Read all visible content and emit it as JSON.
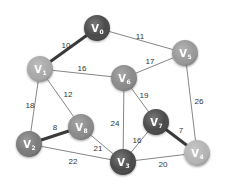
{
  "diagram": {
    "type": "weighted-undirected-graph",
    "nodes": [
      {
        "id": "V0",
        "label": "V",
        "sub": "0",
        "x": 97,
        "y": 28,
        "color": "#4a4a4a"
      },
      {
        "id": "V1",
        "label": "V",
        "sub": "1",
        "x": 40,
        "y": 69,
        "color": "#a8a8a8"
      },
      {
        "id": "V2",
        "label": "V",
        "sub": "2",
        "x": 29,
        "y": 144,
        "color": "#7a7a7a"
      },
      {
        "id": "V3",
        "label": "V",
        "sub": "3",
        "x": 123,
        "y": 162,
        "color": "#4a4a4a"
      },
      {
        "id": "V4",
        "label": "V",
        "sub": "4",
        "x": 197,
        "y": 153,
        "color": "#b4b4b4"
      },
      {
        "id": "V5",
        "label": "V",
        "sub": "5",
        "x": 185,
        "y": 53,
        "color": "#999999"
      },
      {
        "id": "V6",
        "label": "V",
        "sub": "6",
        "x": 124,
        "y": 78,
        "color": "#8a8a8a"
      },
      {
        "id": "V7",
        "label": "V",
        "sub": "7",
        "x": 156,
        "y": 122,
        "color": "#4a4a4a"
      },
      {
        "id": "V8",
        "label": "V",
        "sub": "8",
        "x": 81,
        "y": 127,
        "color": "#8a8a8a"
      }
    ],
    "edges": [
      {
        "from": "V0",
        "to": "V1",
        "weight": "10",
        "highlighted": true,
        "lx": 66,
        "ly": 46
      },
      {
        "from": "V0",
        "to": "V5",
        "weight": "11",
        "highlighted": false,
        "lx": 140,
        "ly": 37
      },
      {
        "from": "V1",
        "to": "V6",
        "weight": "16",
        "highlighted": false,
        "lx": 82,
        "ly": 69
      },
      {
        "from": "V6",
        "to": "V5",
        "weight": "17",
        "highlighted": false,
        "lx": 150,
        "ly": 62
      },
      {
        "from": "V1",
        "to": "V2",
        "weight": "18",
        "highlighted": false,
        "lx": 30,
        "ly": 106
      },
      {
        "from": "V1",
        "to": "V8",
        "weight": "12",
        "highlighted": false,
        "lx": 68,
        "ly": 95
      },
      {
        "from": "V2",
        "to": "V8",
        "weight": "8",
        "highlighted": true,
        "lx": 55,
        "ly": 128
      },
      {
        "from": "V2",
        "to": "V3",
        "weight": "22",
        "highlighted": false,
        "lx": 73,
        "ly": 162
      },
      {
        "from": "V8",
        "to": "V3",
        "weight": "21",
        "highlighted": false,
        "lx": 98,
        "ly": 149
      },
      {
        "from": "V6",
        "to": "V3",
        "weight": "24",
        "highlighted": false,
        "lx": 115,
        "ly": 124
      },
      {
        "from": "V6",
        "to": "V7",
        "weight": "19",
        "highlighted": false,
        "lx": 144,
        "ly": 96
      },
      {
        "from": "V5",
        "to": "V4",
        "weight": "26",
        "highlighted": false,
        "lx": 199,
        "ly": 102
      },
      {
        "from": "V7",
        "to": "V3",
        "weight": "16",
        "highlighted": false,
        "lx": 137,
        "ly": 141
      },
      {
        "from": "V7",
        "to": "V4",
        "weight": "7",
        "highlighted": true,
        "lx": 181,
        "ly": 131
      },
      {
        "from": "V3",
        "to": "V4",
        "weight": "20",
        "highlighted": false,
        "lx": 163,
        "ly": 165
      }
    ],
    "colors": {
      "edge": "#666666",
      "edge_highlight": "#3a3a3a",
      "label": "#333333",
      "background": "#ffffff"
    }
  }
}
